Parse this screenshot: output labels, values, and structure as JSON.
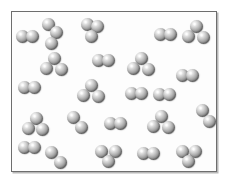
{
  "figure": {
    "background_color": "#ffffff",
    "panel_color": "#fdfdfd",
    "border_color": "#6e6e6e",
    "shadow_color": "#b8b8b8",
    "atom_color_light": "#ffffff",
    "atom_color_mid": "#b6b6b6",
    "atom_color_dark": "#5e5e5e",
    "atom_diameter": 13,
    "panel": {
      "x": 11,
      "y": 11,
      "width": 206,
      "height": 161
    }
  },
  "legend": {
    "diatomic_label": "diatomic molecule",
    "triatomic_label": "triatomic molecule"
  },
  "counts": {
    "diatomic": 13,
    "triatomic": 10,
    "total_molecules": 23,
    "total_atoms": 56
  },
  "molecules": [
    {
      "type": "diatomic",
      "name": "molecule-diatomic-1",
      "atoms": [
        {
          "x": 16,
          "y": 30
        },
        {
          "x": 26,
          "y": 30
        }
      ]
    },
    {
      "type": "triatomic",
      "name": "molecule-triatomic-1",
      "atoms": [
        {
          "x": 42,
          "y": 18
        },
        {
          "x": 50,
          "y": 26
        },
        {
          "x": 45,
          "y": 37
        }
      ]
    },
    {
      "type": "triatomic",
      "name": "molecule-triatomic-2",
      "atoms": [
        {
          "x": 81,
          "y": 18
        },
        {
          "x": 91,
          "y": 20
        },
        {
          "x": 85,
          "y": 30
        }
      ]
    },
    {
      "type": "diatomic",
      "name": "molecule-diatomic-2",
      "atoms": [
        {
          "x": 154,
          "y": 28
        },
        {
          "x": 164,
          "y": 28
        }
      ]
    },
    {
      "type": "triatomic",
      "name": "molecule-triatomic-3",
      "atoms": [
        {
          "x": 190,
          "y": 20
        },
        {
          "x": 182,
          "y": 30
        },
        {
          "x": 197,
          "y": 31
        }
      ]
    },
    {
      "type": "triatomic",
      "name": "molecule-triatomic-4",
      "atoms": [
        {
          "x": 48,
          "y": 52
        },
        {
          "x": 40,
          "y": 62
        },
        {
          "x": 55,
          "y": 63
        }
      ]
    },
    {
      "type": "diatomic",
      "name": "molecule-diatomic-3",
      "atoms": [
        {
          "x": 92,
          "y": 54
        },
        {
          "x": 102,
          "y": 54
        }
      ]
    },
    {
      "type": "triatomic",
      "name": "molecule-triatomic-5",
      "atoms": [
        {
          "x": 135,
          "y": 52
        },
        {
          "x": 127,
          "y": 62
        },
        {
          "x": 142,
          "y": 63
        }
      ]
    },
    {
      "type": "diatomic",
      "name": "molecule-diatomic-4",
      "atoms": [
        {
          "x": 176,
          "y": 69
        },
        {
          "x": 186,
          "y": 69
        }
      ]
    },
    {
      "type": "diatomic",
      "name": "molecule-diatomic-5",
      "atoms": [
        {
          "x": 18,
          "y": 81
        },
        {
          "x": 28,
          "y": 81
        }
      ]
    },
    {
      "type": "triatomic",
      "name": "molecule-triatomic-6",
      "atoms": [
        {
          "x": 85,
          "y": 79
        },
        {
          "x": 77,
          "y": 89
        },
        {
          "x": 92,
          "y": 90
        }
      ]
    },
    {
      "type": "diatomic",
      "name": "molecule-diatomic-6",
      "atoms": [
        {
          "x": 125,
          "y": 87
        },
        {
          "x": 135,
          "y": 87
        }
      ]
    },
    {
      "type": "triatomic",
      "name": "molecule-triatomic-7",
      "atoms": [
        {
          "x": 30,
          "y": 112
        },
        {
          "x": 22,
          "y": 122
        },
        {
          "x": 36,
          "y": 123
        }
      ]
    },
    {
      "type": "diatomic",
      "name": "molecule-diatomic-7",
      "atoms": [
        {
          "x": 67,
          "y": 111
        },
        {
          "x": 75,
          "y": 121
        }
      ]
    },
    {
      "type": "diatomic",
      "name": "molecule-diatomic-8",
      "atoms": [
        {
          "x": 104,
          "y": 117
        },
        {
          "x": 114,
          "y": 117
        }
      ]
    },
    {
      "type": "triatomic",
      "name": "molecule-triatomic-8",
      "atoms": [
        {
          "x": 155,
          "y": 110
        },
        {
          "x": 147,
          "y": 120
        },
        {
          "x": 162,
          "y": 121
        }
      ]
    },
    {
      "type": "diatomic",
      "name": "molecule-diatomic-9",
      "atoms": [
        {
          "x": 196,
          "y": 104
        },
        {
          "x": 203,
          "y": 115
        }
      ]
    },
    {
      "type": "diatomic",
      "name": "molecule-diatomic-10",
      "atoms": [
        {
          "x": 45,
          "y": 146
        },
        {
          "x": 54,
          "y": 156
        }
      ]
    },
    {
      "type": "triatomic",
      "name": "molecule-triatomic-9",
      "atoms": [
        {
          "x": 95,
          "y": 145
        },
        {
          "x": 109,
          "y": 145
        },
        {
          "x": 102,
          "y": 155
        }
      ]
    },
    {
      "type": "diatomic",
      "name": "molecule-diatomic-11",
      "atoms": [
        {
          "x": 137,
          "y": 147
        },
        {
          "x": 147,
          "y": 147
        }
      ]
    },
    {
      "type": "triatomic",
      "name": "molecule-triatomic-10",
      "atoms": [
        {
          "x": 176,
          "y": 145
        },
        {
          "x": 189,
          "y": 145
        },
        {
          "x": 182,
          "y": 155
        }
      ]
    },
    {
      "type": "diatomic",
      "name": "molecule-diatomic-12",
      "atoms": [
        {
          "x": 18,
          "y": 141
        },
        {
          "x": 28,
          "y": 141
        }
      ]
    },
    {
      "type": "diatomic",
      "name": "molecule-diatomic-13",
      "atoms": [
        {
          "x": 153,
          "y": 88
        },
        {
          "x": 163,
          "y": 88
        }
      ]
    }
  ]
}
